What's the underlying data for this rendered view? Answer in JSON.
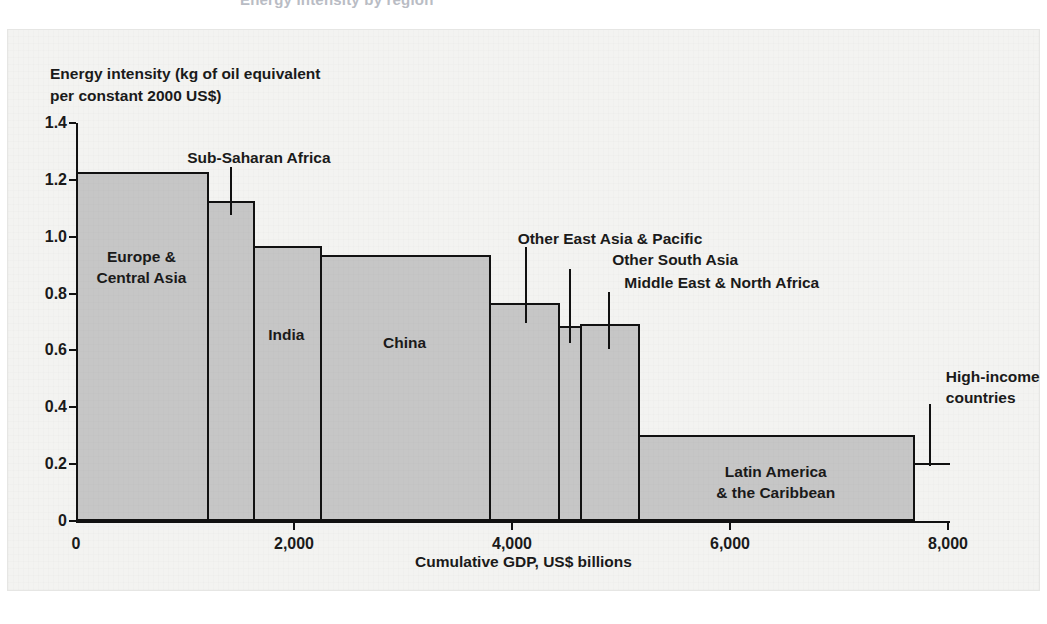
{
  "clipped_top_text": "Energy intensity by region",
  "chart_data": {
    "type": "bar",
    "variant": "variable-width-bar (marimekko / cumulative GDP width)",
    "title": "",
    "ylabel": "Energy intensity (kg of oil equivalent\nper constant 2000 US$)",
    "xlabel": "Cumulative GDP, US$ billions",
    "xlim": [
      0,
      8000
    ],
    "ylim": [
      0,
      1.4
    ],
    "yticks": [
      "0",
      "0.2",
      "0.4",
      "0.6",
      "0.8",
      "1.0",
      "1.2",
      "1.4"
    ],
    "ytick_values": [
      0,
      0.2,
      0.4,
      0.6,
      0.8,
      1.0,
      1.2,
      1.4
    ],
    "xticks": [
      "0",
      "2,000",
      "4,000",
      "6,000",
      "8,000"
    ],
    "xtick_values": [
      0,
      2000,
      4000,
      6000,
      8000
    ],
    "grid": false,
    "legend": "none",
    "reference_line_y": 0.2,
    "bar_fill": "#C6C6C6",
    "bar_stroke": "#111111",
    "categories": [
      "Europe & Central Asia",
      "Sub-Saharan Africa",
      "India",
      "China",
      "Other East Asia & Pacific",
      "Other South Asia",
      "Middle East & North Africa",
      "Latin America & the Caribbean",
      "High-income countries"
    ],
    "bars": [
      {
        "label": "Europe &\nCentral Asia",
        "energy_intensity": 1.22,
        "gdp_start": 0,
        "gdp_end": 1200,
        "gdp_width": 1200,
        "label_placement": "inside",
        "callout": false
      },
      {
        "label": "Sub-Saharan Africa",
        "energy_intensity": 1.12,
        "gdp_start": 1200,
        "gdp_end": 1620,
        "gdp_width": 420,
        "label_placement": "callout-above",
        "callout": true
      },
      {
        "label": "India",
        "energy_intensity": 0.96,
        "gdp_start": 1620,
        "gdp_end": 2240,
        "gdp_width": 620,
        "label_placement": "inside",
        "callout": false
      },
      {
        "label": "China",
        "energy_intensity": 0.93,
        "gdp_start": 2240,
        "gdp_end": 3790,
        "gdp_width": 1550,
        "label_placement": "inside",
        "callout": false
      },
      {
        "label": "Other East Asia & Pacific",
        "energy_intensity": 0.76,
        "gdp_start": 3790,
        "gdp_end": 4420,
        "gdp_width": 630,
        "label_placement": "callout-above",
        "callout": true
      },
      {
        "label": "Other South Asia",
        "energy_intensity": 0.68,
        "gdp_start": 4420,
        "gdp_end": 4620,
        "gdp_width": 200,
        "label_placement": "callout-above",
        "callout": true
      },
      {
        "label": "Middle East & North Africa",
        "energy_intensity": 0.685,
        "gdp_start": 4620,
        "gdp_end": 5160,
        "gdp_width": 540,
        "label_placement": "callout-above",
        "callout": true
      },
      {
        "label": "Latin America\n& the Caribbean",
        "energy_intensity": 0.295,
        "gdp_start": 5160,
        "gdp_end": 7680,
        "gdp_width": 2520,
        "label_placement": "inside",
        "callout": false
      },
      {
        "label": "High-income\ncountries",
        "energy_intensity": null,
        "gdp_start": 7680,
        "gdp_end": 7680,
        "gdp_width": 0,
        "label_placement": "callout-right",
        "callout": true,
        "note": "label only, points at right edge of final bar"
      }
    ]
  }
}
